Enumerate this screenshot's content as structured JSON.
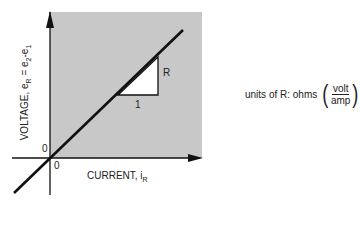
{
  "figure": {
    "x_axis": {
      "label": "CURRENT, i",
      "subscript": "R",
      "origin_label": "0"
    },
    "y_axis": {
      "label_prefix": "VOLTAGE, e",
      "label_sub1": "R",
      "label_mid": " = e",
      "label_sub2": "2",
      "label_dash": "-e",
      "label_sub3": "1",
      "origin_label": "0"
    },
    "slope_triangle": {
      "run_label": "1",
      "rise_label": "R"
    },
    "units_note": {
      "prefix": "units of R: ohms",
      "numerator": "volt",
      "denominator": "amp"
    },
    "colors": {
      "shaded_region": "#c8c8c8",
      "line": "#111111",
      "triangle_fill": "#ffffff"
    }
  }
}
